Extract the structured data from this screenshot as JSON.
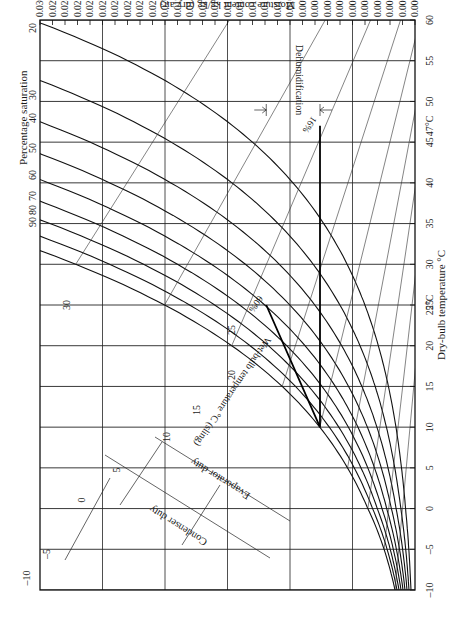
{
  "chart_data": {
    "type": "line",
    "orientation": "rotated 90° (dry-bulb axis vertical on right, moisture axis horizontal on top)",
    "xlabel": "Dry-bulb temperature °C",
    "ylabel": "Moisture content kg/kg (dry air)",
    "curve_family_label": "Percentage saturation",
    "wet_bulb_label": "Wet-bulb temperature °C (sling)",
    "x_ticks": [
      -10,
      -5,
      0,
      5,
      10,
      15,
      20,
      25,
      30,
      35,
      40,
      45,
      50,
      55,
      60
    ],
    "x_special_ticks": [
      "25°C",
      "47°C"
    ],
    "xlim": [
      -10,
      60
    ],
    "y_ticks": [
      "0.000",
      "0.001",
      "0.002",
      "0.003",
      "0.004",
      "0.005",
      "0.006",
      "0.007",
      "0.008",
      "0.009",
      "0.010",
      "0.011",
      "0.012",
      "0.013",
      "0.014",
      "0.015",
      "0.016",
      "0.017",
      "0.018",
      "0.019",
      "0.020",
      "0.021",
      "0.022",
      "0.023",
      "0.024",
      "0.025",
      "0.026",
      "0.027",
      "0.028",
      "0.029",
      "0.030"
    ],
    "ylim": [
      0.0,
      0.03
    ],
    "saturation_curves": [
      {
        "label": "20",
        "pct": 20
      },
      {
        "label": "30",
        "pct": 30
      },
      {
        "label": "40",
        "pct": 40
      },
      {
        "label": "50",
        "pct": 50
      },
      {
        "label": "60",
        "pct": 60
      },
      {
        "label": "70",
        "pct": 70
      },
      {
        "label": "80",
        "pct": 80
      },
      {
        "label": "90",
        "pct": 90
      },
      {
        "label": "",
        "pct": 100
      }
    ],
    "wet_bulb_lines": [
      {
        "label": "-10",
        "t": -10
      },
      {
        "label": "-5",
        "t": -5
      },
      {
        "label": "0",
        "t": 0
      },
      {
        "label": "5",
        "t": 5
      },
      {
        "label": "10",
        "t": 10
      },
      {
        "label": "15",
        "t": 15
      },
      {
        "label": "20",
        "t": 20
      },
      {
        "label": "25",
        "t": 25
      },
      {
        "label": "30",
        "t": 30
      }
    ],
    "process_points": [
      {
        "name": "room",
        "db": 25,
        "rh_label": "60%",
        "moisture": 0.0119
      },
      {
        "name": "coil",
        "db": 10,
        "moisture": 0.0076
      },
      {
        "name": "reheat",
        "db": 47,
        "rh_label": "16%",
        "moisture": 0.0076
      }
    ],
    "annotations": [
      "Dehumidification",
      "Evaporator duty",
      "Condenser duty",
      "60%",
      "16%"
    ],
    "grid": true,
    "legend": "none"
  },
  "labels": {
    "percentage_saturation": "Percentage saturation",
    "moisture_axis": "Moisture content kg/kg (dry air)",
    "drybulb_axis": "Dry-bulb temperature °C",
    "wetbulb_axis": "Wet-bulb temperature °C (sling)",
    "dehumidification": "Dehumidification",
    "evaporator_duty": "Evaporator duty",
    "condenser_duty": "Condenser duty",
    "pt_60": "60%",
    "pt_16": "16%",
    "db_25": "25°C",
    "db_47": "47°C"
  }
}
